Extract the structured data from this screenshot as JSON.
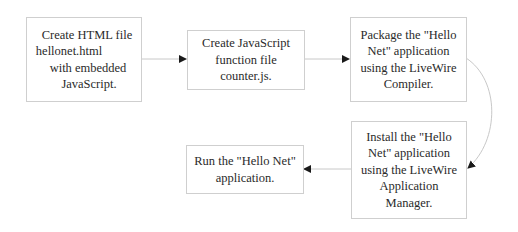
{
  "diagram": {
    "type": "flowchart",
    "steps": [
      {
        "id": "step1",
        "lines": [
          "Create HTML file",
          "hellonet.html",
          "with embedded",
          "JavaScript."
        ]
      },
      {
        "id": "step2",
        "lines": [
          "Create JavaScript",
          "function file",
          "counter.js."
        ]
      },
      {
        "id": "step3",
        "lines": [
          "Package the \"Hello",
          "Net\" application",
          "using the LiveWire",
          "Compiler."
        ]
      },
      {
        "id": "step4",
        "lines": [
          "Install the \"Hello",
          "Net\" application",
          "using the LiveWire",
          "Application",
          "Manager."
        ]
      },
      {
        "id": "step5",
        "lines": [
          "Run the \"Hello Net\"",
          "application."
        ]
      }
    ],
    "edges": [
      {
        "from": "step1",
        "to": "step2"
      },
      {
        "from": "step2",
        "to": "step3"
      },
      {
        "from": "step3",
        "to": "step4"
      },
      {
        "from": "step4",
        "to": "step5"
      }
    ],
    "colors": {
      "border": "#cfcfcf",
      "line": "#c8c8c8",
      "arrow": "#1a1a1a",
      "text": "#2a2a2a"
    }
  }
}
